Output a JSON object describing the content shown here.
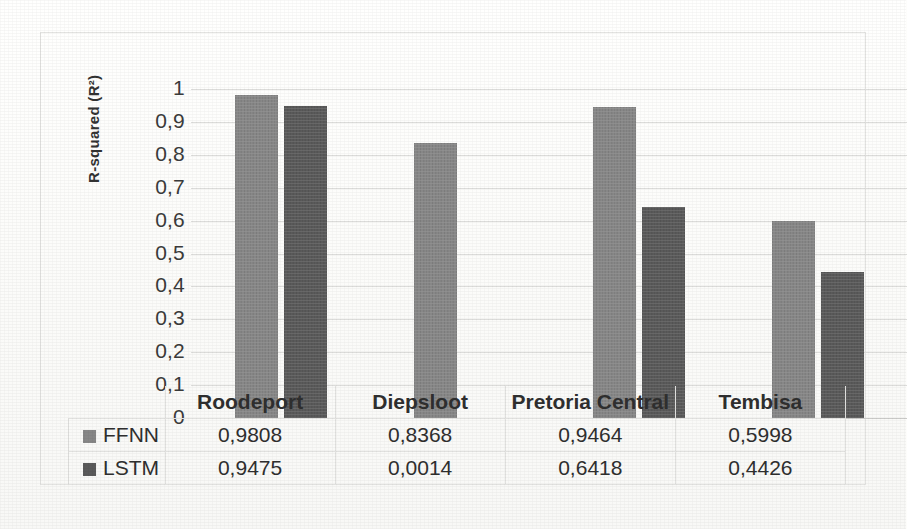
{
  "chart_data": {
    "type": "bar",
    "title": "",
    "xlabel": "",
    "ylabel": "R-squared (R²)",
    "categories": [
      "Roodeport",
      "Diepsloot",
      "Pretoria Central",
      "Tembisa"
    ],
    "series": [
      {
        "name": "FFNN",
        "color": "#878787",
        "values": [
          0.9808,
          0.8368,
          0.9464,
          0.5998
        ],
        "labels": [
          "0,9808",
          "0,8368",
          "0,9464",
          "0,5998"
        ]
      },
      {
        "name": "LSTM",
        "color": "#5a5a5a",
        "values": [
          0.9475,
          0.0014,
          0.6418,
          0.4426
        ],
        "labels": [
          "0,9475",
          "0,0014",
          "0,6418",
          "0,4426"
        ]
      }
    ],
    "ylim": [
      0,
      1
    ],
    "ytick_values": [
      1,
      0.9,
      0.8,
      0.7,
      0.6,
      0.5,
      0.4,
      0.3,
      0.2,
      0.1,
      0
    ],
    "ytick_labels": [
      "1",
      "0,9",
      "0,8",
      "0,7",
      "0,6",
      "0,5",
      "0,4",
      "0,3",
      "0,2",
      "0,1",
      "0"
    ],
    "grid": true,
    "legend_position": "data-table-left",
    "data_table_visible": true,
    "decimal_separator": ","
  },
  "table": {
    "header_row_labels": [
      "Roodeport",
      "Diepsloot",
      "Pretoria Central",
      "Tembisa"
    ],
    "rows": [
      {
        "series": "FFNN",
        "cells": [
          "0,9808",
          "0,8368",
          "0,9464",
          "0,5998"
        ]
      },
      {
        "series": "LSTM",
        "cells": [
          "0,9475",
          "0,0014",
          "0,6418",
          "0,4426"
        ]
      }
    ]
  },
  "axis": {
    "y_title": "R-squared (R²)"
  }
}
